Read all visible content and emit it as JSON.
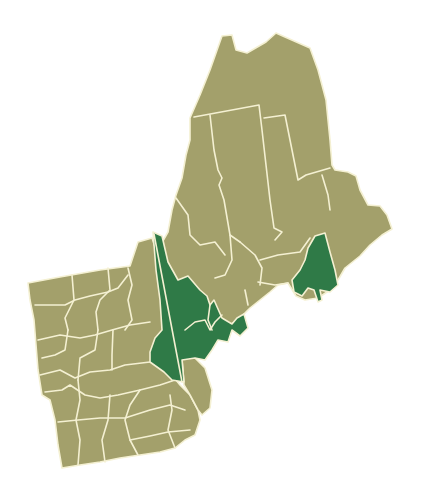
{
  "map": {
    "subject": "New England counties",
    "colors": {
      "background": "#ffffff",
      "base_fill": "#a3a06b",
      "highlight_fill": "#2f7a47",
      "border": "#f4f0d2"
    },
    "legend": [],
    "highlighted_regions": [
      "west-central-strip",
      "central-cluster",
      "coastal-east"
    ]
  }
}
